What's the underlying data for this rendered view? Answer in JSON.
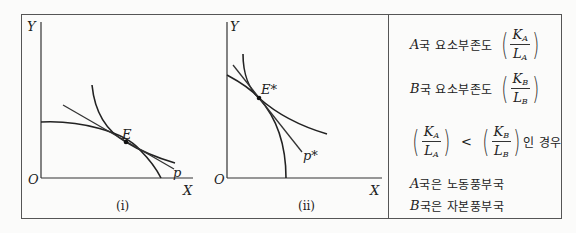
{
  "graph_i": {
    "y_axis_label": "Y",
    "x_axis_label": "X",
    "origin_label": "O",
    "point_label": "E",
    "price_line_label": "p",
    "caption": "(i)"
  },
  "graph_ii": {
    "y_axis_label": "Y",
    "x_axis_label": "X",
    "origin_label": "O",
    "point_label": "E*",
    "price_line_label": "p*",
    "caption": "(ii)"
  },
  "panel": {
    "row1": {
      "country": "A",
      "text": "국 요소부존도",
      "num": "K",
      "num_sub": "A",
      "den": "L",
      "den_sub": "A"
    },
    "row2": {
      "country": "B",
      "text": "국 요소부존도",
      "num": "K",
      "num_sub": "B",
      "den": "L",
      "den_sub": "B"
    },
    "row3": {
      "left": {
        "num": "K",
        "num_sub": "A",
        "den": "L",
        "den_sub": "A"
      },
      "op": "<",
      "right": {
        "num": "K",
        "num_sub": "B",
        "den": "L",
        "den_sub": "B"
      },
      "suffix": "인 경우"
    },
    "row4": {
      "country": "A",
      "text": "국은 노동풍부국"
    },
    "row5": {
      "country": "B",
      "text": "국은 자본풍부국"
    }
  }
}
